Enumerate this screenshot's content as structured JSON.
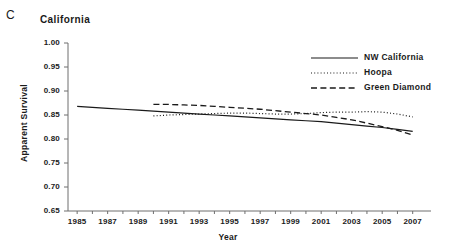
{
  "panel": {
    "label": "C"
  },
  "chart_data": {
    "type": "line",
    "title": "California",
    "xlabel": "Year",
    "ylabel": "Apparent Survival",
    "xlim": [
      1984.4,
      2008.2
    ],
    "ylim": [
      0.65,
      1.0
    ],
    "grid": false,
    "legend_position": "top-right",
    "y_ticks": [
      "1.00",
      "0.95",
      "0.90",
      "0.85",
      "0.80",
      "0.75",
      "0.70",
      "0.65"
    ],
    "y_tick_values": [
      1.0,
      0.95,
      0.9,
      0.85,
      0.8,
      0.75,
      0.7,
      0.65
    ],
    "x_ticks": [
      "1985",
      "1987",
      "1989",
      "1991",
      "1993",
      "1995",
      "1997",
      "1999",
      "2001",
      "2003",
      "2005",
      "2007"
    ],
    "x_tick_values": [
      1985,
      1987,
      1989,
      1991,
      1993,
      1995,
      1997,
      1999,
      2001,
      2003,
      2005,
      2007
    ],
    "x_minor_tick_values": [
      1985,
      1986,
      1987,
      1988,
      1989,
      1990,
      1991,
      1992,
      1993,
      1994,
      1995,
      1996,
      1997,
      1998,
      1999,
      2000,
      2001,
      2002,
      2003,
      2004,
      2005,
      2006,
      2007
    ],
    "series": [
      {
        "name": "NW California",
        "style": "solid",
        "color": "#1a1a1a",
        "x": [
          1985,
          1986,
          1987,
          1988,
          1989,
          1990,
          1991,
          1992,
          1993,
          1994,
          1995,
          1996,
          1997,
          1998,
          1999,
          2000,
          2001,
          2002,
          2003,
          2004,
          2005,
          2006,
          2007
        ],
        "values": [
          0.868,
          0.866,
          0.864,
          0.862,
          0.86,
          0.858,
          0.856,
          0.854,
          0.852,
          0.85,
          0.848,
          0.846,
          0.844,
          0.842,
          0.84,
          0.838,
          0.836,
          0.833,
          0.83,
          0.827,
          0.824,
          0.82,
          0.816
        ]
      },
      {
        "name": "Hoopa",
        "style": "dotted",
        "color": "#1a1a1a",
        "x": [
          1990,
          1991,
          1992,
          1993,
          1994,
          1995,
          1996,
          1997,
          1998,
          1999,
          2000,
          2001,
          2002,
          2003,
          2004,
          2005,
          2006,
          2007
        ],
        "values": [
          0.848,
          0.85,
          0.851,
          0.852,
          0.853,
          0.854,
          0.854,
          0.853,
          0.852,
          0.852,
          0.853,
          0.855,
          0.856,
          0.856,
          0.857,
          0.856,
          0.852,
          0.846
        ]
      },
      {
        "name": "Green Diamond",
        "style": "dashed",
        "color": "#1a1a1a",
        "x": [
          1990,
          1991,
          1992,
          1993,
          1994,
          1995,
          1996,
          1997,
          1998,
          1999,
          2000,
          2001,
          2002,
          2003,
          2004,
          2005,
          2006,
          2007
        ],
        "values": [
          0.872,
          0.872,
          0.871,
          0.87,
          0.868,
          0.866,
          0.864,
          0.862,
          0.859,
          0.856,
          0.853,
          0.85,
          0.845,
          0.84,
          0.833,
          0.826,
          0.818,
          0.808
        ]
      }
    ]
  },
  "legend": {
    "items": [
      {
        "label": "NW California",
        "style": "solid"
      },
      {
        "label": "Hoopa",
        "style": "dotted"
      },
      {
        "label": "Green Diamond",
        "style": "dashed"
      }
    ]
  }
}
